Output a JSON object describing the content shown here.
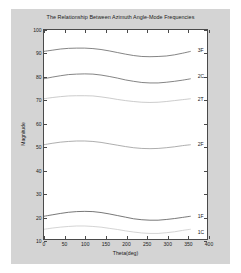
{
  "chart_data": {
    "type": "line",
    "title": "The Relationship Between Azimuth Angle-Mode Frequencies",
    "xlabel": "Theta(deg)",
    "ylabel": "Magnitude",
    "xlim": [
      0,
      400
    ],
    "ylim": [
      10,
      100
    ],
    "xticks": [
      0,
      50,
      100,
      150,
      200,
      250,
      300,
      350,
      400
    ],
    "xticklabels": [
      "0",
      "50",
      "100",
      "150",
      "200",
      "250",
      "300",
      "350",
      "400"
    ],
    "yticks": [
      10,
      20,
      30,
      40,
      50,
      60,
      70,
      80,
      90,
      100
    ],
    "yticklabels": [
      "10",
      "20",
      "30",
      "40",
      "50",
      "60",
      "70",
      "80",
      "90",
      "100"
    ],
    "grid": false,
    "legend_position": "inline-right-of-curve",
    "x": [
      0,
      20,
      40,
      60,
      80,
      100,
      120,
      140,
      160,
      180,
      200,
      220,
      240,
      260,
      280,
      300,
      320,
      340,
      360
    ],
    "series": [
      {
        "name": "3F",
        "label": "3F",
        "color": "#666666",
        "label_x": 363,
        "label_y": 91.5,
        "values": [
          90.8,
          91.3,
          91.8,
          92.1,
          92.2,
          92.2,
          92.0,
          91.6,
          91.0,
          90.3,
          89.6,
          89.0,
          88.6,
          88.5,
          88.6,
          88.8,
          89.3,
          90.0,
          90.8
        ]
      },
      {
        "name": "2C",
        "label": "2C",
        "color": "#666666",
        "label_x": 363,
        "label_y": 80.2,
        "values": [
          79.0,
          79.7,
          80.3,
          80.8,
          81.0,
          81.1,
          81.0,
          80.6,
          80.0,
          79.3,
          78.5,
          77.9,
          77.4,
          77.2,
          77.2,
          77.5,
          77.9,
          78.4,
          79.0
        ]
      },
      {
        "name": "2T",
        "label": "2T",
        "color": "#bfbfbf",
        "label_x": 363,
        "label_y": 70.6,
        "values": [
          70.4,
          70.9,
          71.3,
          71.6,
          71.7,
          71.7,
          71.6,
          71.2,
          70.7,
          70.1,
          69.6,
          69.2,
          68.9,
          68.8,
          68.9,
          69.2,
          69.6,
          70.0,
          70.4
        ]
      },
      {
        "name": "2F",
        "label": "2F",
        "color": "#999999",
        "label_x": 363,
        "label_y": 51.2,
        "values": [
          50.6,
          51.2,
          51.7,
          52.0,
          52.2,
          52.2,
          52.0,
          51.6,
          51.0,
          50.4,
          49.8,
          49.3,
          49.0,
          48.9,
          49.0,
          49.3,
          49.7,
          50.2,
          50.6
        ]
      },
      {
        "name": "1F",
        "label": "1F",
        "color": "#555555",
        "label_x": 363,
        "label_y": 20.6,
        "values": [
          19.8,
          20.4,
          21.0,
          21.5,
          21.8,
          21.9,
          21.8,
          21.4,
          20.8,
          20.1,
          19.4,
          18.7,
          18.3,
          18.1,
          18.1,
          18.4,
          18.8,
          19.3,
          19.8
        ]
      },
      {
        "name": "1C",
        "label": "1C",
        "color": "#c9c9c9",
        "label_x": 363,
        "label_y": 13.8,
        "values": [
          14.2,
          14.7,
          15.1,
          15.4,
          15.6,
          15.6,
          15.4,
          15.1,
          14.6,
          14.1,
          13.5,
          13.0,
          12.6,
          12.4,
          12.4,
          12.7,
          13.1,
          13.7,
          14.2
        ]
      }
    ]
  }
}
